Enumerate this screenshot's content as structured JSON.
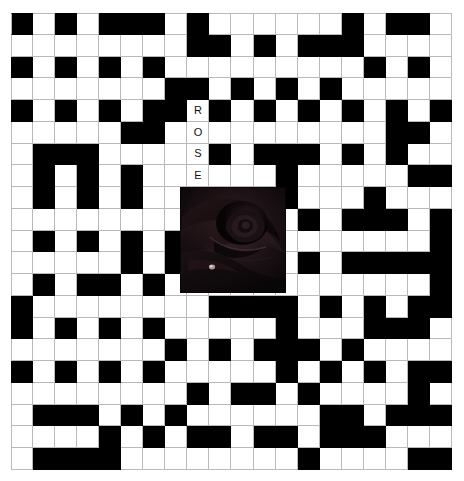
{
  "page": {
    "type": "crossword-puzzle-grid",
    "background_color": "#ffffff",
    "grid_line_color": "#b9b9b9",
    "filled_cell_color": "#000000",
    "empty_cell_color": "#ffffff"
  },
  "grid": {
    "columns": 20,
    "rows": 21,
    "cell_size_px": 22,
    "origin": {
      "x": 11,
      "y": 13
    },
    "legend": {
      "b": "black-filled-cell",
      "w": "white-open-cell"
    },
    "rows_data": [
      "bwbwbbbwbwwwwwwbwbbw",
      "wwwwwwwwbbwbwbbbwwww",
      "bwbwbwbwwwwwwwwwbwbw",
      "wwwwwwwbbwbwbwbwwwww",
      "bwbwbwbbwbwbwbwbwbwb",
      "wwwwwbbwwwwwwwwwwbbw",
      "wbbbwwwwwbwbbbwbwbww",
      "wbwbwbwwwwwwbwwwwwbb",
      "wbwbwbwwwwwwbwwwbwww",
      "wwwwwwwwwwwwwbwbbbwb",
      "wbwbwbwbwwwwwwwwwwwb",
      "wwwwwbwbwwwwwbwbbbbb",
      "wbwbbwbwwwwwwwwwwwwb",
      "bwwwwwwwwbbbbwbwbwbb",
      "bwbwbwbwwwwwbwwwbbbw",
      "wwwwwwwbwbwbbbwbwwww",
      "bwbwbwbwwwwwbwbwbwbb",
      "wwwwwwwwbwbbwbwwwwbw",
      "wbbbwbwbwwwwwwbbwbbb",
      "wwwwbwbwbbwbbwbbbwww",
      "wbbbbwwwwwwwwbwwwwbb"
    ],
    "letters": [
      {
        "row": 5,
        "col": 9,
        "char": "R"
      },
      {
        "row": 6,
        "col": 9,
        "char": "O"
      },
      {
        "row": 7,
        "col": 9,
        "char": "S"
      },
      {
        "row": 8,
        "col": 9,
        "char": "E"
      }
    ],
    "answer_word": "ROSE"
  },
  "photo": {
    "subject": "rose-flower-photograph",
    "description": "dark close-up photograph of a rose bloom",
    "position": {
      "left": 180,
      "top": 187,
      "width": 106,
      "height": 106
    },
    "dominant_colors": [
      "#050304",
      "#150d10",
      "#2a1b1f",
      "#3d282c",
      "#0a0607"
    ]
  }
}
